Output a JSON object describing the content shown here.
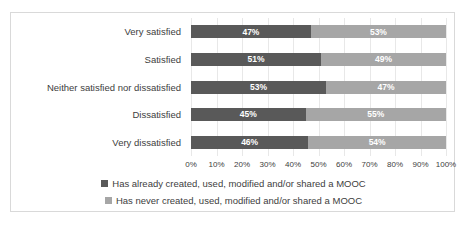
{
  "chart_data": {
    "type": "bar",
    "orientation": "horizontal",
    "stacked": true,
    "normalized_percent": true,
    "title": "",
    "subtitle": "",
    "xlabel": "",
    "ylabel": "",
    "xlim": [
      0,
      100
    ],
    "xticks": [
      "0%",
      "10%",
      "20%",
      "30%",
      "40%",
      "50%",
      "60%",
      "70%",
      "80%",
      "90%",
      "100%"
    ],
    "xtick_values": [
      0,
      10,
      20,
      30,
      40,
      50,
      60,
      70,
      80,
      90,
      100
    ],
    "grid": true,
    "grid_axis": "x",
    "legend_position": "bottom",
    "categories": [
      "Very satisfied",
      "Satisfied",
      "Neither satisfied nor dissatisfied",
      "Dissatisfied",
      "Very dissatisfied"
    ],
    "series": [
      {
        "name": "Has already created, used, modified and/or shared a MOOC",
        "color": "#595959",
        "values": [
          47,
          51,
          53,
          45,
          46
        ],
        "labels": [
          "47%",
          "51%",
          "53%",
          "45%",
          "46%"
        ]
      },
      {
        "name": "Has never created, used, modified and/or shared a MOOC",
        "color": "#a6a6a6",
        "values": [
          53,
          49,
          47,
          55,
          54
        ],
        "labels": [
          "53%",
          "49%",
          "47%",
          "55%",
          "54%"
        ]
      }
    ]
  },
  "style": {
    "frame_border_color": "#d9d9d9",
    "gridline_color": "#e8e8e8",
    "text_color": "#404040",
    "data_label_color": "#ffffff",
    "background": "#ffffff"
  }
}
